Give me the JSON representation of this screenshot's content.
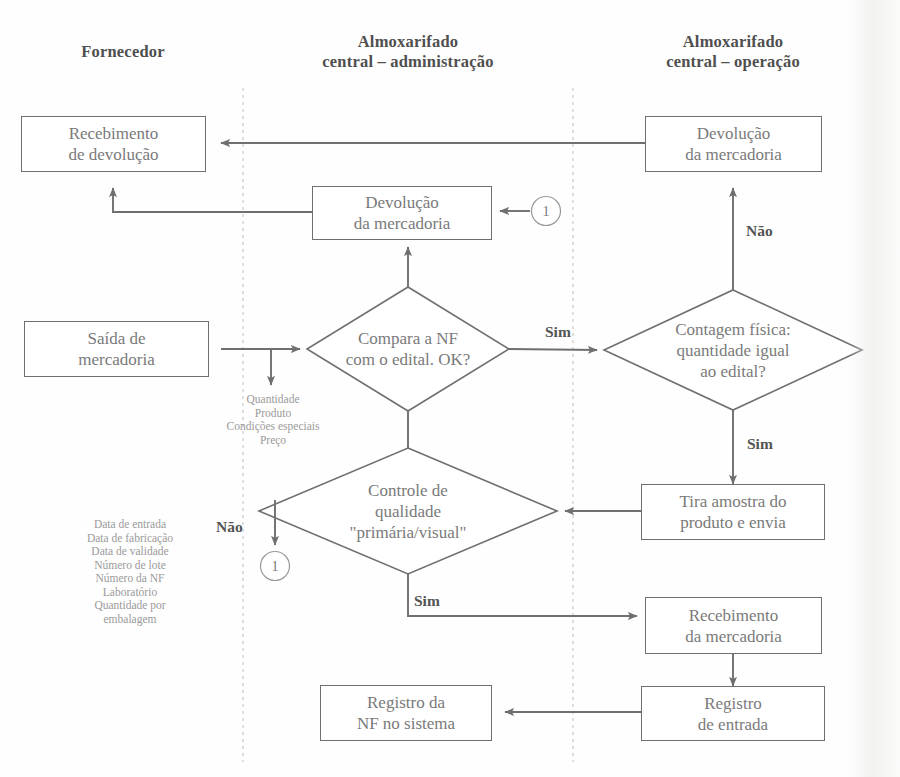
{
  "diagram": {
    "lanes": [
      {
        "id": "fornecedor",
        "label": "Fornecedor"
      },
      {
        "id": "almox-adm",
        "label": "Almoxarifado\ncentral – administração"
      },
      {
        "id": "almox-op",
        "label": "Almoxarifado\ncentral – operação"
      }
    ],
    "lane_titles": {
      "fornecedor": "Fornecedor",
      "almox_adm_line1": "Almoxarifado",
      "almox_adm_line2": "central – administração",
      "almox_op_line1": "Almoxarifado",
      "almox_op_line2": "central – operação"
    },
    "nodes": {
      "recebimento_devolucao": {
        "line1": "Recebimento",
        "line2": "de devolução",
        "shape": "box",
        "lane": "fornecedor"
      },
      "devolucao_mercadoria_op": {
        "line1": "Devolução",
        "line2": "da mercadoria",
        "shape": "box",
        "lane": "almox-op"
      },
      "devolucao_mercadoria_adm": {
        "line1": "Devolução",
        "line2": "da mercadoria",
        "shape": "box",
        "lane": "almox-adm"
      },
      "saida_mercadoria": {
        "line1": "Saída de",
        "line2": "mercadoria",
        "shape": "box",
        "lane": "fornecedor"
      },
      "compara_nf": {
        "line1": "Compara a NF",
        "line2": "com o edital. OK?",
        "shape": "diamond",
        "lane": "almox-adm"
      },
      "contagem_fisica": {
        "line1": "Contagem física:",
        "line2": "quantidade igual",
        "line3": "ao edital?",
        "shape": "diamond",
        "lane": "almox-op"
      },
      "controle_qualidade": {
        "line1": "Controle de",
        "line2": "qualidade",
        "line3": "\"primária/visual\"",
        "shape": "diamond",
        "lane": "almox-adm"
      },
      "tira_amostra": {
        "line1": "Tira amostra do",
        "line2": "produto e envia",
        "shape": "box",
        "lane": "almox-op"
      },
      "recebimento_mercadoria": {
        "line1": "Recebimento",
        "line2": "da mercadoria",
        "shape": "box",
        "lane": "almox-op"
      },
      "registro_entrada": {
        "line1": "Registro",
        "line2": "de entrada",
        "shape": "box",
        "lane": "almox-op"
      },
      "registro_nf": {
        "line1": "Registro da",
        "line2": "NF no sistema",
        "shape": "box",
        "lane": "almox-adm"
      }
    },
    "edge_labels": {
      "sim_compara": "Sim",
      "nao_contagem": "Não",
      "sim_contagem": "Sim",
      "nao_controle": "Não",
      "sim_controle": "Sim"
    },
    "connectors": {
      "off_page_1_left": "1",
      "off_page_1_right": "1"
    },
    "annotations": {
      "nf_fields": {
        "lines": [
          "Quantidade",
          "Produto",
          "Condições especiais",
          "Preço"
        ]
      },
      "lote_fields": {
        "lines": [
          "Data de entrada",
          "Data de fabricação",
          "Data de validade",
          "Número de lote",
          "Número da NF",
          "Laboratório",
          "Quantidade por",
          "embalagem"
        ]
      }
    },
    "colors": {
      "line": "#6f6f6f",
      "text": "#7a7a7a",
      "bold_text": "#4f4f4f",
      "annotation_text": "#9a9a9a",
      "lane_divider": "#c8c8c8",
      "background": "#fefefe"
    }
  }
}
